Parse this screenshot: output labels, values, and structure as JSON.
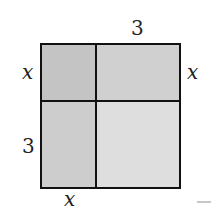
{
  "figure": {
    "type": "area-model-square",
    "colors": {
      "top_left": "#c4c4c4",
      "top_right": "#d0d0d0",
      "bottom_left": "#cdcdcd",
      "bottom_right": "#dedede",
      "border": "#111111"
    },
    "labels": {
      "top": "3",
      "left_upper": "x",
      "right_upper": "x",
      "left_lower": "3",
      "bottom": "x"
    }
  }
}
